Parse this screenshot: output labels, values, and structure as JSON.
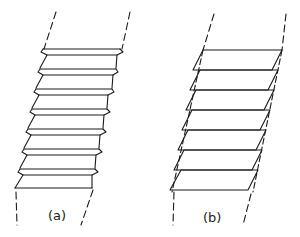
{
  "figure": {
    "panels": [
      {
        "id": "a",
        "label": "(a)",
        "description": "stack of layers with zigzag stepped edges between dashed guide lines",
        "layer_count": 7
      },
      {
        "id": "b",
        "label": "(b)",
        "description": "stack of sheared parallelogram plates between dashed guide lines",
        "plate_count": 7
      }
    ],
    "colors": {
      "line": "#1a1a1a",
      "background": "#ffffff"
    }
  }
}
